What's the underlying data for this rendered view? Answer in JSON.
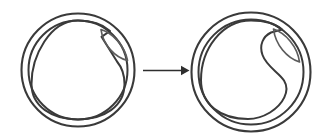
{
  "figure": {
    "title": "Schematic transformation of a circular vesicle with an internal lens-shaped inclusion",
    "background_color": "#ffffff",
    "width": 329,
    "height": 140,
    "stroke_color_primary": "#3a3a3a",
    "stroke_color_secondary": "#5c5c5c",
    "arrow_color": "#2e2e2e"
  },
  "panels": [
    {
      "id": "left",
      "label": "",
      "name": "left-vesicle",
      "center_x": 78,
      "center_y": 70,
      "outer_radius": 63,
      "inner_radius": 56,
      "description": "Double-walled circular outline enclosing a rounded inner contour with a pointed notch at the upper right; a tilted lens-shaped body sits against the notch."
    },
    {
      "id": "right",
      "label": "",
      "name": "right-vesicle",
      "center_x": 251,
      "center_y": 72,
      "outer_radius": 61,
      "inner_radius": 54,
      "description": "Double-walled circular outline enclosing a rounded inner contour with a deep concave indentation on the right; a tilted lens-shaped body occupies the indentation."
    }
  ],
  "arrow": {
    "name": "transformation-arrow",
    "label": "",
    "direction": "right",
    "x_start": 143,
    "x_end": 188,
    "y": 70
  },
  "caption": {
    "text": ""
  }
}
